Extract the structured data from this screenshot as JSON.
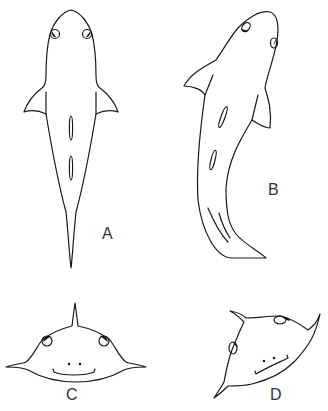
{
  "figure": {
    "panels": [
      {
        "id": "A",
        "label": "A",
        "description": "shark, dorsal view, straight body"
      },
      {
        "id": "B",
        "label": "B",
        "description": "shark, dorsal view, body curved"
      },
      {
        "id": "C",
        "label": "C",
        "description": "shark head, frontal view"
      },
      {
        "id": "D",
        "label": "D",
        "description": "shark head, frontal view, tilted"
      }
    ],
    "colors": {
      "line": "#1a1a1a",
      "label": "#333333",
      "background": "#ffffff"
    }
  }
}
